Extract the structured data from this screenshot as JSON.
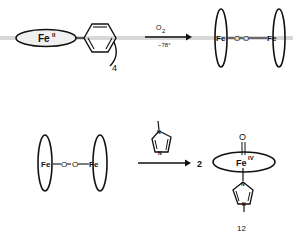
{
  "reaction1": {
    "reactant": {
      "metal": "Fe",
      "oxidation": "II",
      "subscript": "4"
    },
    "arrow": {
      "above": "O",
      "above_sub": "2",
      "below": "−78°"
    },
    "product": {
      "left_metal": "Fe",
      "bridge": [
        "O",
        "O"
      ],
      "right_metal": "Fe"
    }
  },
  "reaction2": {
    "reactant": {
      "left_metal": "Fe",
      "bridge": [
        "O",
        "O"
      ],
      "right_metal": "Fe"
    },
    "reagent": {
      "name": "N-methylimidazole",
      "atom_label": "N"
    },
    "coefficient": "2",
    "product": {
      "metal": "Fe",
      "oxidation": "IV",
      "axial_top": "O",
      "axial_bottom_atom": "N",
      "compound_number": "12"
    }
  },
  "colors": {
    "ink": "#111111",
    "scan_band": "#bdbdbd"
  }
}
